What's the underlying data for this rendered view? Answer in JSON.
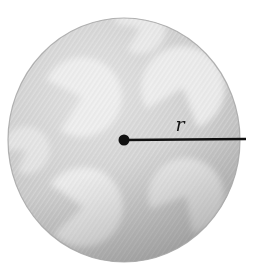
{
  "figure": {
    "name": "circle-radius-diagram",
    "background_color": "#ffffff",
    "disc": {
      "name": "textured-gray-disc",
      "center_x": 124,
      "center_y": 140,
      "radius_x": 116,
      "radius_y": 122,
      "base_color": "#c9c9c9",
      "highlight_color": "#f2f2f2",
      "shadow_color": "#a8a8a8",
      "edge_color": "#9a9a9a",
      "texture": "diagonal-hatch"
    },
    "center_dot": {
      "name": "center-point",
      "x": 124,
      "y": 140,
      "radius": 5.5,
      "color": "#111111"
    },
    "radius_line": {
      "name": "radius-segment",
      "x1": 124,
      "y1": 140,
      "x2": 246,
      "y2": 139,
      "color": "#111111",
      "width": 2.4
    },
    "radius_label": {
      "name": "radius-label",
      "text": "r",
      "x": 180,
      "y": 131,
      "color": "#141414"
    },
    "blobs": [
      {
        "name": "pac-blob-top-left",
        "cx": 82,
        "cy": 97,
        "r": 40,
        "rotation": 205,
        "gap_deg": 82,
        "opacity": 0.82
      },
      {
        "name": "pac-blob-top-right",
        "cx": 183,
        "cy": 88,
        "r": 42,
        "rotation": 150,
        "gap_deg": 80,
        "opacity": 0.8
      },
      {
        "name": "pac-blob-bottom-left",
        "cx": 83,
        "cy": 207,
        "r": 40,
        "rotation": 215,
        "gap_deg": 78,
        "opacity": 0.78
      },
      {
        "name": "pac-blob-bottom-right",
        "cx": 186,
        "cy": 196,
        "r": 38,
        "rotation": 160,
        "gap_deg": 80,
        "opacity": 0.76
      },
      {
        "name": "pac-blob-top-edge",
        "cx": 140,
        "cy": 28,
        "r": 26,
        "rotation": 190,
        "gap_deg": 70,
        "opacity": 0.7
      },
      {
        "name": "pac-blob-left-edge",
        "cx": 26,
        "cy": 150,
        "r": 24,
        "rotation": 180,
        "gap_deg": 70,
        "opacity": 0.55
      }
    ]
  }
}
